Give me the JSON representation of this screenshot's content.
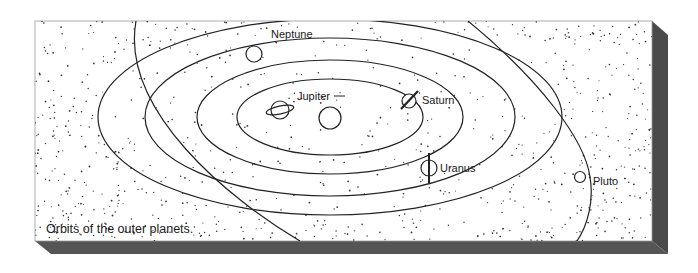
{
  "caption": "Orbits of the outer planets.",
  "colors": {
    "background": "#ffffff",
    "panel": "#ffffff",
    "shadow": "#4a4a4a",
    "ink": "#222222",
    "stipple": "#333333"
  },
  "sun": {
    "name": "Sun",
    "shown_as": "central circle"
  },
  "planets": [
    {
      "name": "Jupiter",
      "label": "Jupiter"
    },
    {
      "name": "Saturn",
      "label": "Saturn"
    },
    {
      "name": "Uranus",
      "label": "Uranus"
    },
    {
      "name": "Neptune",
      "label": "Neptune"
    },
    {
      "name": "Pluto",
      "label": "Pluto"
    }
  ],
  "orbits": [
    "Jupiter orbit",
    "Saturn orbit",
    "Uranus orbit",
    "Neptune orbit",
    "Pluto orbit (inclined, crossing)"
  ]
}
